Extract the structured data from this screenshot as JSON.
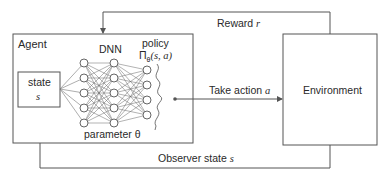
{
  "diagram": {
    "type": "reinforcement-learning-loop",
    "agent": {
      "label": "Agent",
      "state_box": {
        "label": "state",
        "symbol": "s"
      },
      "dnn": {
        "label": "DNN",
        "layers": [
          5,
          5,
          4
        ],
        "parameter_label": "parameter θ"
      },
      "policy": {
        "label": "policy",
        "symbol": "Π",
        "subscript": "θ",
        "args": "(s, a)"
      }
    },
    "environment": {
      "label": "Environment"
    },
    "arrows": {
      "reward": {
        "label": "Reward",
        "symbol": "r"
      },
      "action": {
        "label": "Take action",
        "symbol": "a"
      },
      "observation": {
        "label": "Observer state",
        "symbol": "s"
      }
    },
    "colors": {
      "line": "#555555",
      "text": "#2a2a2a",
      "background": "#ffffff"
    }
  }
}
